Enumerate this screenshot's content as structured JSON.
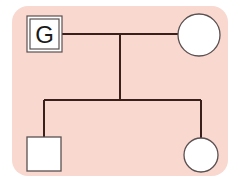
{
  "diagram": {
    "type": "pedigree",
    "colors": {
      "background": "#f9d8d0",
      "line": "#3a1f1a",
      "symbol_stroke": "#5a5050",
      "symbol_fill": "#ffffff"
    },
    "individuals": [
      {
        "id": "parent-male",
        "shape": "square",
        "style": "double-border",
        "label": "G",
        "generation": 1
      },
      {
        "id": "parent-female",
        "shape": "circle",
        "label": "",
        "generation": 1
      },
      {
        "id": "child-male",
        "shape": "square",
        "label": "",
        "generation": 2
      },
      {
        "id": "child-female",
        "shape": "circle",
        "label": "",
        "generation": 2
      }
    ],
    "relationships": [
      {
        "type": "mating",
        "from": "parent-male",
        "to": "parent-female"
      },
      {
        "type": "descent",
        "from": "mating",
        "to": [
          "child-male",
          "child-female"
        ]
      }
    ]
  }
}
